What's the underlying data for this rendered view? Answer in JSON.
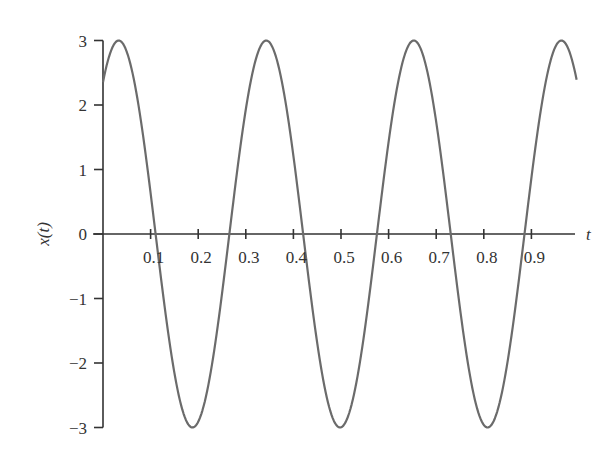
{
  "chart_data": {
    "type": "line",
    "title": "",
    "xlabel": "t",
    "ylabel": "x(t)",
    "xlim": [
      0,
      1
    ],
    "ylim": [
      -3,
      3
    ],
    "grid": false,
    "legend": null,
    "x_ticks": [
      0.1,
      0.2,
      0.3,
      0.4,
      0.5,
      0.6,
      0.7,
      0.8,
      0.9
    ],
    "x_tick_labels": [
      "0.1",
      "0.2",
      "0.3",
      "0.4",
      "0.5",
      "0.6",
      "0.7",
      "0.8",
      "0.9"
    ],
    "y_ticks": [
      3,
      2,
      1,
      0,
      -1,
      -2,
      -3
    ],
    "y_tick_labels": [
      "3",
      "2",
      "1",
      "0",
      "−1",
      "−2",
      "−3"
    ],
    "series": [
      {
        "name": "x(t)",
        "color": "#6b6b6b",
        "description": "sinusoid, amplitude 3, period ~0.31, x(0) ~ 2.5",
        "amplitude": 3,
        "period": 0.31,
        "phase_peak_t": 0.033,
        "t_start": 0,
        "t_end": 0.995,
        "x": [
          0,
          0.035,
          0.11,
          0.19,
          0.27,
          0.35,
          0.42,
          0.5,
          0.58,
          0.66,
          0.73,
          0.81,
          0.89,
          0.97,
          0.995
        ],
        "y": [
          2.5,
          3,
          0,
          -3,
          0,
          3,
          0,
          -3,
          0,
          3,
          0,
          -3,
          0,
          3,
          2.5
        ]
      }
    ]
  },
  "colors": {
    "axis": "#333333",
    "curve": "#6b6b6b",
    "background": "#ffffff"
  }
}
